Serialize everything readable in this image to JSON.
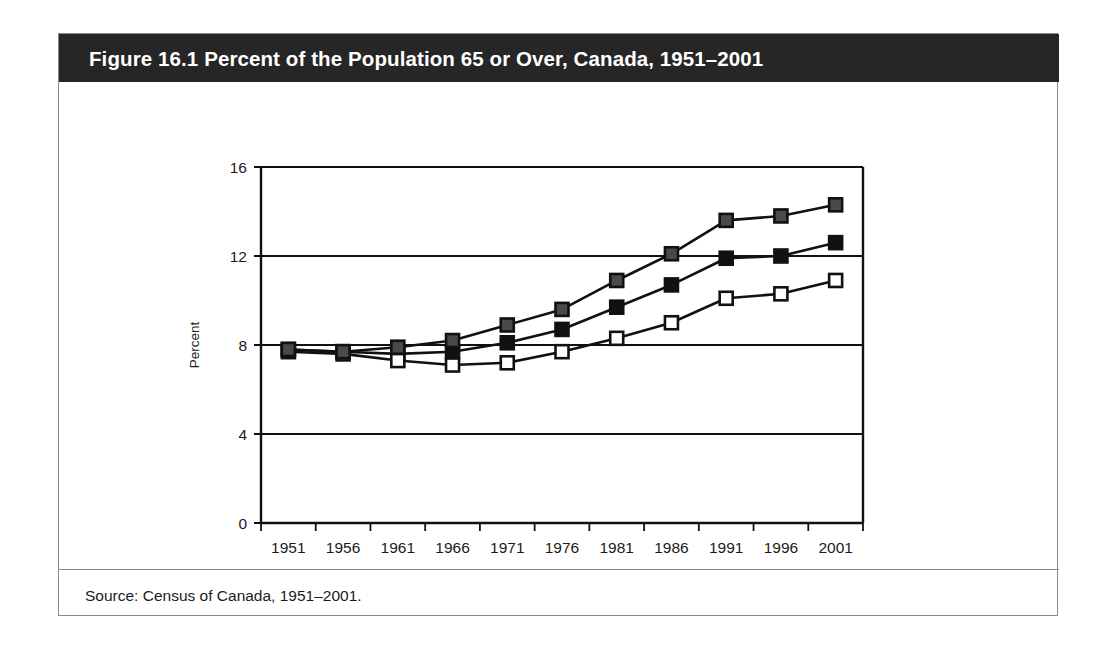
{
  "figure": {
    "title": "Figure 16.1 Percent of the Population 65 or Over, Canada, 1951–2001",
    "source": "Source: Census of Canada, 1951–2001.",
    "banner_color": "#262626",
    "border_color": "#8a8a8a",
    "background_color": "#ffffff"
  },
  "chart_data": {
    "type": "line",
    "title": "Figure 16.1 Percent of the Population 65 or Over, Canada, 1951–2001",
    "xlabel": "",
    "ylabel": "Percent",
    "categories": [
      "1951",
      "1956",
      "1961",
      "1966",
      "1971",
      "1976",
      "1981",
      "1986",
      "1991",
      "1996",
      "2001"
    ],
    "series": [
      {
        "name": "Total",
        "marker": "filled-square",
        "color": "#151515",
        "values": [
          7.8,
          7.7,
          7.6,
          7.7,
          8.1,
          8.7,
          9.7,
          10.7,
          11.9,
          12.0,
          12.6
        ]
      },
      {
        "name": "Male",
        "marker": "open-square",
        "color": "#151515",
        "values": [
          7.7,
          7.6,
          7.3,
          7.1,
          7.2,
          7.7,
          8.3,
          9.0,
          10.1,
          10.3,
          10.9
        ]
      },
      {
        "name": "Female",
        "marker": "shaded-square",
        "color": "#3d3d3d",
        "values": [
          7.8,
          7.7,
          7.9,
          8.2,
          8.9,
          9.6,
          10.9,
          12.1,
          13.6,
          13.8,
          14.3
        ]
      }
    ],
    "ylim": [
      0,
      16
    ],
    "yticks": [
      0,
      4,
      8,
      12,
      16
    ],
    "ytick_labels": [
      "0",
      "4",
      "8",
      "12",
      "16"
    ],
    "grid": "horizontal",
    "legend_position": "bottom",
    "legend_entries": [
      "Total",
      "Male",
      "Female"
    ]
  }
}
